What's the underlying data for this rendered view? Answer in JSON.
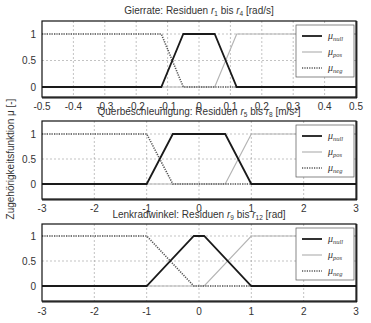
{
  "figure": {
    "ylabel": "Zugehörigkeitsfunktion μ [-]"
  },
  "chart_data": [
    {
      "type": "line",
      "title": "Gierrate: Residuen r1 bis r4 [rad/s]",
      "title_parts": {
        "pre": "Gierrate: Residuen ",
        "sym1": "r",
        "sub1": "1",
        "mid": " bis ",
        "sym2": "r",
        "sub2": "4",
        "post": " [rad/s]"
      },
      "xlabel": "",
      "ylabel": "",
      "xlim": [
        -0.5,
        0.5
      ],
      "ylim": [
        -0.25,
        1.25
      ],
      "xticks": [
        -0.5,
        -0.4,
        -0.3,
        -0.2,
        -0.1,
        0,
        0.1,
        0.2,
        0.3,
        0.4,
        0.5
      ],
      "xtick_labels": [
        "-0.5",
        "-0.4",
        "-0.3",
        "-0.2",
        "-0.1",
        "0",
        "0.1",
        "0.2",
        "0.3",
        "0.4",
        "0.5"
      ],
      "yticks": [
        0,
        0.5,
        1
      ],
      "ytick_labels": [
        "0",
        "0.5",
        "1"
      ],
      "grid": true,
      "legend_position": "upper right",
      "series": [
        {
          "name": "μnull",
          "label_sym": "μ",
          "label_sub": "null",
          "style": "solid-dark",
          "x": [
            -0.5,
            -0.12,
            -0.05,
            0.05,
            0.12,
            0.5
          ],
          "y": [
            0,
            0,
            1,
            1,
            0,
            0
          ]
        },
        {
          "name": "μpos",
          "label_sym": "μ",
          "label_sub": "pos",
          "style": "solid-light",
          "x": [
            -0.5,
            0.05,
            0.12,
            0.5
          ],
          "y": [
            0,
            0,
            1,
            1
          ]
        },
        {
          "name": "μneg",
          "label_sym": "μ",
          "label_sub": "neg",
          "style": "dotted",
          "x": [
            -0.5,
            -0.12,
            -0.05,
            0.5
          ],
          "y": [
            1,
            1,
            0,
            0
          ]
        }
      ]
    },
    {
      "type": "line",
      "title": "Querbeschleunigung: Residuen r5 bis r8 [m/s²]",
      "title_parts": {
        "pre": "Querbeschleunigung: Residuen ",
        "sym1": "r",
        "sub1": "5",
        "mid": " bis ",
        "sym2": "r",
        "sub2": "8",
        "post": " [m/s²]"
      },
      "xlabel": "",
      "ylabel": "",
      "xlim": [
        -3,
        3
      ],
      "ylim": [
        -0.3,
        1.3
      ],
      "xticks": [
        -3,
        -2,
        -1,
        0,
        1,
        2,
        3
      ],
      "xtick_labels": [
        "-3",
        "-2",
        "-1",
        "0",
        "1",
        "2",
        "3"
      ],
      "yticks": [
        0,
        0.5,
        1
      ],
      "ytick_labels": [
        "0",
        "0.5",
        "1"
      ],
      "grid": true,
      "legend_position": "upper right",
      "series": [
        {
          "name": "μnull",
          "label_sym": "μ",
          "label_sub": "null",
          "style": "solid-dark",
          "x": [
            -3,
            -1,
            -0.5,
            0.5,
            1,
            3
          ],
          "y": [
            0,
            0,
            1,
            1,
            0,
            0
          ]
        },
        {
          "name": "μpos",
          "label_sym": "μ",
          "label_sub": "pos",
          "style": "solid-light",
          "x": [
            -3,
            0.5,
            1,
            3
          ],
          "y": [
            0,
            0,
            1,
            1
          ]
        },
        {
          "name": "μneg",
          "label_sym": "μ",
          "label_sub": "neg",
          "style": "dotted",
          "x": [
            -3,
            -1,
            -0.5,
            3
          ],
          "y": [
            1,
            1,
            0,
            0
          ]
        }
      ]
    },
    {
      "type": "line",
      "title": "Lenkradwinkel: Residuen r9 bis r12 [rad]",
      "title_parts": {
        "pre": "Lenkradwinkel: Residuen ",
        "sym1": "r",
        "sub1": "9",
        "mid": " bis ",
        "sym2": "r",
        "sub2": "12",
        "post": " [rad]"
      },
      "xlabel": "",
      "ylabel": "",
      "xlim": [
        -3,
        3
      ],
      "ylim": [
        -0.3,
        1.3
      ],
      "xticks": [
        -3,
        -2,
        -1,
        0,
        1,
        2,
        3
      ],
      "xtick_labels": [
        "-3",
        "-2",
        "-1",
        "0",
        "1",
        "2",
        "3"
      ],
      "yticks": [
        0,
        0.5,
        1
      ],
      "ytick_labels": [
        "0",
        "0.5",
        "1"
      ],
      "grid": true,
      "legend_position": "upper right",
      "series": [
        {
          "name": "μnull",
          "label_sym": "μ",
          "label_sub": "null",
          "style": "solid-dark",
          "x": [
            -3,
            -1,
            -0.1,
            0.1,
            1,
            3
          ],
          "y": [
            0,
            0,
            1,
            1,
            0,
            0
          ]
        },
        {
          "name": "μpos",
          "label_sym": "μ",
          "label_sub": "pos",
          "style": "solid-light",
          "x": [
            -3,
            0.1,
            1,
            3
          ],
          "y": [
            0,
            0,
            1,
            1
          ]
        },
        {
          "name": "μneg",
          "label_sym": "μ",
          "label_sub": "neg",
          "style": "dotted",
          "x": [
            -3,
            -1,
            -0.1,
            3
          ],
          "y": [
            1,
            1,
            0,
            0
          ]
        }
      ]
    }
  ],
  "colors": {
    "null_line": "#1a1a1a",
    "pos_line": "#b4b4b4",
    "neg_line": "#555555",
    "grid": "#9a9a9a",
    "frame": "#111111",
    "text": "#333333"
  }
}
